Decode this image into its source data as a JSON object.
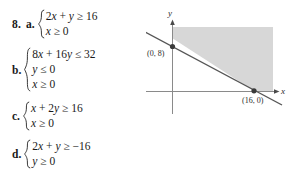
{
  "exercise": {
    "number": "8.",
    "parts": [
      {
        "letter": "a.",
        "equations": [
          "2x + y ≥ 16",
          "x ≥ 0"
        ]
      },
      {
        "letter": "b.",
        "equations": [
          "8x + 16y ≤ 32",
          "y ≤ 0",
          "x ≥ 0"
        ]
      },
      {
        "letter": "c.",
        "equations": [
          "x + 2y ≥ 16",
          "x ≥ 0"
        ]
      },
      {
        "letter": "d.",
        "equations": [
          "2x + y ≥ −16",
          "y ≥ 0"
        ]
      }
    ]
  },
  "graph": {
    "x_axis_label": "x",
    "y_axis_label": "y",
    "point_labels": {
      "y_intercept": "(0, 8)",
      "x_intercept": "(16, 0)"
    },
    "colors": {
      "shading": "#d7d7d7",
      "line": "#555555",
      "axis": "#808080",
      "point": "#3a3a3a"
    }
  },
  "chart_data": {
    "type": "line",
    "title": "",
    "xlabel": "x",
    "ylabel": "y",
    "grid": false,
    "legend": null,
    "annotations": [
      "(0, 8)",
      "(16, 0)"
    ],
    "series": [
      {
        "name": "boundary line",
        "comment": "x + 2y = 16",
        "x": [
          0,
          16
        ],
        "y": [
          8,
          0
        ]
      }
    ],
    "shaded_region": {
      "description": "half-plane above and right of boundary line, x + 2y >= 16",
      "vertices": [
        [
          0,
          8
        ],
        [
          16,
          0
        ]
      ]
    },
    "intercepts": {
      "y": [
        0,
        8
      ],
      "x": [
        16,
        0
      ]
    }
  }
}
